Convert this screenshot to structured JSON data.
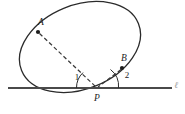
{
  "figure": {
    "background_color": "#ffffff",
    "stroke_color": "#2b2b2b",
    "line_color": "#4a4a4a",
    "dash_color": "#3a3a3a",
    "faint_color": "#9a9a9a",
    "canvas": {
      "width": 185,
      "height": 114
    }
  },
  "ellipse": {
    "name": "tilted-ellipse",
    "center_x": 80,
    "center_y": 47,
    "radius_x": 63,
    "radius_y": 42,
    "rotation_deg": -22,
    "stroke_width": 1.3
  },
  "baseline": {
    "name": "horizontal-line",
    "x1": 8,
    "y1": 88,
    "x2": 172,
    "y2": 88,
    "stroke_width": 2.2,
    "label": "ℓ",
    "label_x": 176,
    "label_y": 86
  },
  "points": [
    {
      "id": "A",
      "label": "A",
      "dot_x": 38,
      "dot_y": 32,
      "label_x": 41,
      "label_y": 23,
      "dot_r": 2.1
    },
    {
      "id": "B",
      "label": "B",
      "dot_x": 122,
      "dot_y": 68,
      "label_x": 124,
      "label_y": 59,
      "dot_r": 2.1
    },
    {
      "id": "P",
      "label": "P",
      "dot_x": 97,
      "dot_y": 88,
      "label_x": 97,
      "label_y": 99,
      "dot_r": 0
    }
  ],
  "segments": [
    {
      "name": "segment-A-to-P",
      "from": "A",
      "to": "P",
      "x1": 39.5,
      "y1": 33.5,
      "x2": 96,
      "y2": 87,
      "style": "dashed",
      "dash_pattern": "4,2.6"
    },
    {
      "name": "segment-B-to-P",
      "from": "B",
      "to": "P",
      "x1": 121,
      "y1": 69.5,
      "x2": 98,
      "y2": 87,
      "style": "dashed",
      "dash_pattern": "4,2.6"
    }
  ],
  "angles": [
    {
      "id": "1",
      "label": "1",
      "label_x": 77,
      "label_y": 78,
      "arc_path": "M 76.5 88 A 21 21 0 0 1 83.0 72.6",
      "vertex": "P",
      "between": [
        "baseline-left",
        "segment-A-to-P"
      ]
    },
    {
      "id": "2",
      "label": "2",
      "label_x": 127,
      "label_y": 76,
      "arc_path": "M 118.5 88 A 21 21 0 0 0 110.5 69.5",
      "vertex": "P",
      "between": [
        "segment-B-to-P",
        "baseline-right"
      ]
    }
  ]
}
